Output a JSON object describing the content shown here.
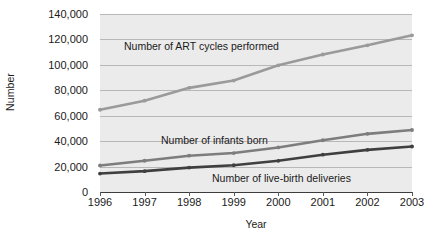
{
  "chart_data": {
    "type": "line",
    "title": "",
    "xlabel": "Year",
    "ylabel": "Number",
    "categories": [
      "1996",
      "1997",
      "1998",
      "1999",
      "2000",
      "2001",
      "2002",
      "2003"
    ],
    "x": [
      1996,
      1997,
      1998,
      1999,
      2000,
      2001,
      2002,
      2003
    ],
    "ylim": [
      0,
      140000
    ],
    "xlim": [
      1996,
      2003
    ],
    "yticks": [
      0,
      20000,
      40000,
      60000,
      80000,
      100000,
      120000,
      140000
    ],
    "ytick_labels": [
      "0",
      "20,000",
      "40,000",
      "60,000",
      "80,000",
      "100,000",
      "120,000",
      "140,000"
    ],
    "grid": true,
    "legend": "inline-annotations",
    "series": [
      {
        "name": "Number of ART cycles performed",
        "color": "#9a9a9a",
        "values": [
          64681,
          71826,
          81899,
          87636,
          99629,
          108130,
          115392,
          123242
        ]
      },
      {
        "name": "Number of infants born",
        "color": "#7d7d7d",
        "values": [
          20840,
          24582,
          28552,
          30629,
          35025,
          40687,
          45751,
          48756
        ]
      },
      {
        "name": "Number of live-birth deliveries",
        "color": "#3f3f3f",
        "values": [
          14507,
          16396,
          19200,
          21020,
          24557,
          29344,
          33140,
          35785
        ]
      }
    ],
    "annotations": [
      {
        "text": "Number of ART cycles performed",
        "series": "Number of ART cycles performed"
      },
      {
        "text": "Number of infants born",
        "series": "Number of infants born"
      },
      {
        "text": "Number of live-birth deliveries",
        "series": "Number of live-birth deliveries"
      }
    ]
  }
}
